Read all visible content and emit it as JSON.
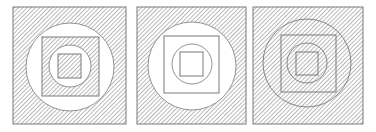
{
  "figure": {
    "colors": {
      "stroke": "#7a7a7a",
      "hatch": "#8a8a8a",
      "background": "#ffffff"
    },
    "panels": [
      {
        "id": "panel-1",
        "x": 13,
        "y": 7,
        "w": 113,
        "h": 117,
        "layers": [
          {
            "shape": "square",
            "hatched": true
          },
          {
            "shape": "circle",
            "hatched": false
          },
          {
            "shape": "square",
            "hatched": true
          },
          {
            "shape": "circle",
            "hatched": false
          },
          {
            "shape": "square",
            "hatched": true
          }
        ]
      },
      {
        "id": "panel-2",
        "x": 137,
        "y": 7,
        "w": 109,
        "h": 117,
        "layers": [
          {
            "shape": "square",
            "hatched": true
          },
          {
            "shape": "circle",
            "hatched": false
          },
          {
            "shape": "square",
            "hatched": false
          },
          {
            "shape": "circle",
            "hatched": false
          },
          {
            "shape": "square",
            "hatched": false
          }
        ]
      },
      {
        "id": "panel-3",
        "x": 253,
        "y": 7,
        "w": 110,
        "h": 117,
        "layers": [
          {
            "shape": "square",
            "hatched": true
          },
          {
            "shape": "circle",
            "hatched": true
          },
          {
            "shape": "square",
            "hatched": true
          },
          {
            "shape": "circle",
            "hatched": true
          },
          {
            "shape": "square",
            "hatched": true
          }
        ]
      }
    ]
  }
}
